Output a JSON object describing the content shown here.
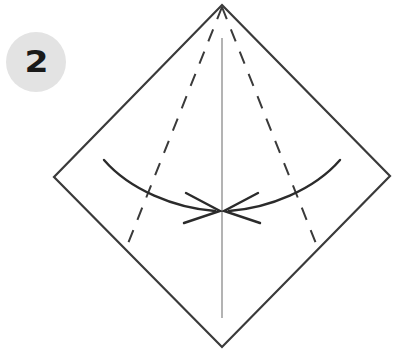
{
  "figure": {
    "type": "origami-fold-instruction-diagram",
    "background_color": "#ffffff",
    "canvas": {
      "width": 403,
      "height": 363
    }
  },
  "step_badge": {
    "number": "2",
    "shape": "circle",
    "fill_color": "#e3e3e3",
    "text_color": "#1a1a1a",
    "center": {
      "x": 36,
      "y": 62
    },
    "radius": 30
  },
  "paper": {
    "name": "square-sheet-rotated-45",
    "stroke_color": "#3a3a3a",
    "stroke_width": 2.2,
    "fill_color": "#ffffff",
    "vertices": {
      "top": {
        "x": 222,
        "y": 5
      },
      "left": {
        "x": 54,
        "y": 177
      },
      "right": {
        "x": 390,
        "y": 176
      },
      "bottom": {
        "x": 222,
        "y": 347
      }
    },
    "points_attr": "222,5 390,176 222,347 54,177"
  },
  "center_line": {
    "name": "vertical-center-crease",
    "style": "solid-thin",
    "stroke_color": "#8a8a8a",
    "stroke_width": 1.3,
    "from": {
      "x": 222,
      "y": 38
    },
    "to": {
      "x": 222,
      "y": 318
    }
  },
  "fold_lines": [
    {
      "name": "left-fold-crease",
      "style": "dashed",
      "stroke_color": "#3a3a3a",
      "stroke_width": 2.0,
      "dash_pattern": "13 11",
      "from": {
        "x": 222,
        "y": 7
      },
      "to": {
        "x": 127,
        "y": 246
      }
    },
    {
      "name": "right-fold-crease",
      "style": "dashed",
      "stroke_color": "#3a3a3a",
      "stroke_width": 2.0,
      "dash_pattern": "13 11",
      "from": {
        "x": 222,
        "y": 7
      },
      "to": {
        "x": 317,
        "y": 246
      }
    }
  ],
  "arrows": [
    {
      "name": "left-fold-arrow",
      "direction": "right",
      "stroke_color": "#2b2b2b",
      "stroke_width": 2.4,
      "path_d": "M 104 160 C 130 190 175 208 215 211",
      "head_d": "M 186 193 L 220 211 L 184 223"
    },
    {
      "name": "right-fold-arrow",
      "direction": "left",
      "stroke_color": "#2b2b2b",
      "stroke_width": 2.4,
      "path_d": "M 340 160 C 314 190 269 208 229 211",
      "head_d": "M 258 193 L 224 211 L 260 223"
    }
  ]
}
